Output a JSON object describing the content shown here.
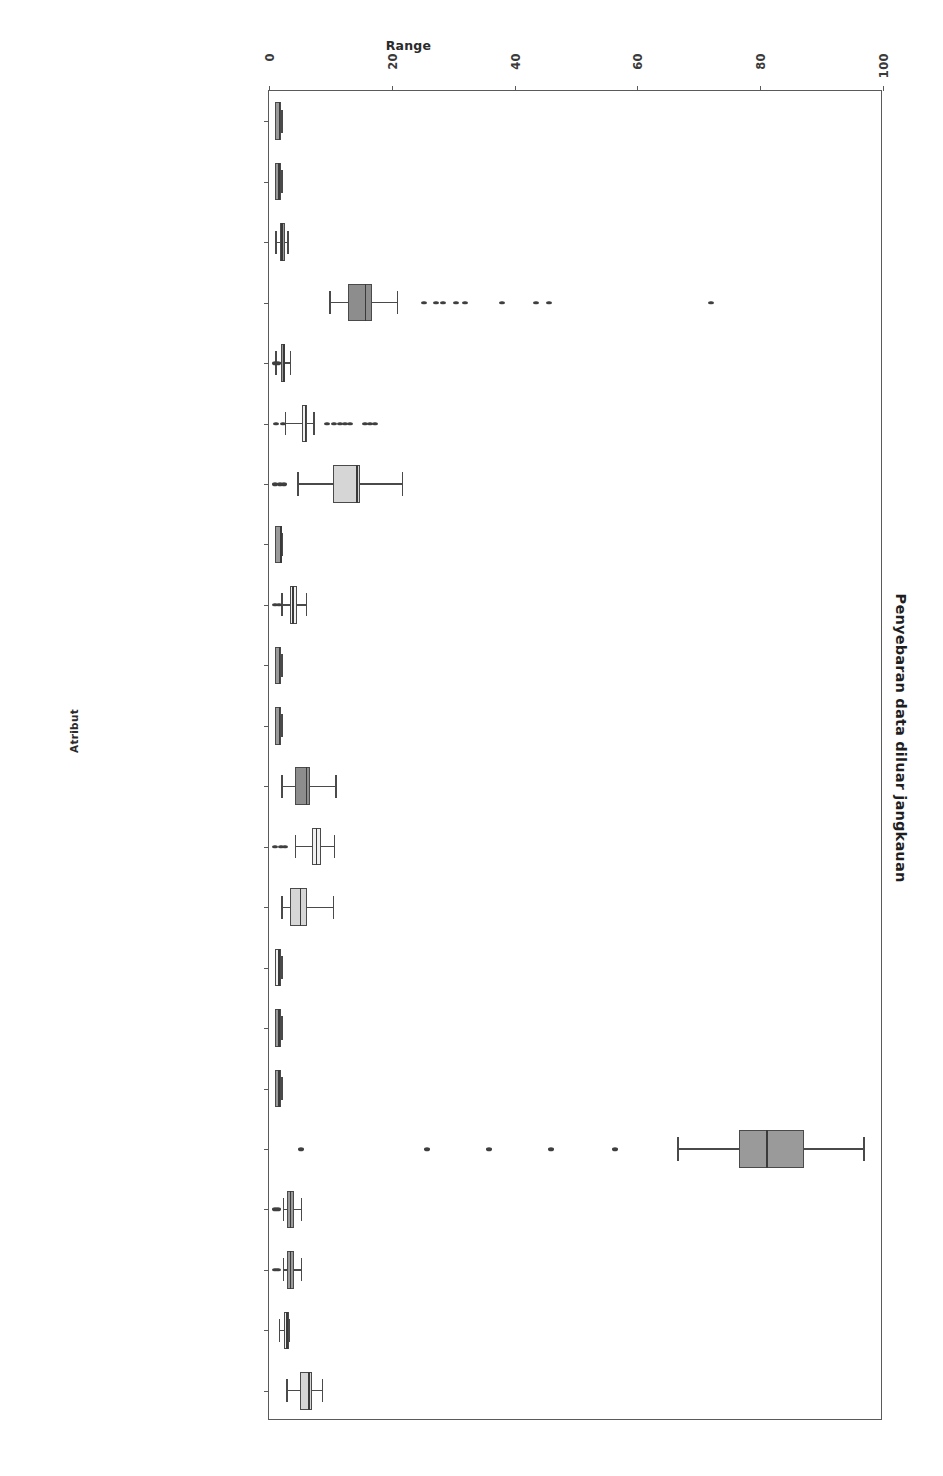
{
  "chart_title": "Penyebaran data diluar jangkauan",
  "axes": {
    "x_title": "Range",
    "y_title": "Atribut",
    "x_ticks": [
      "0",
      "20",
      "40",
      "60",
      "80",
      "100"
    ],
    "x_tick_values": [
      0,
      20,
      40,
      60,
      80,
      100
    ],
    "xlim": [
      0,
      100
    ]
  },
  "chart_data": {
    "type": "box",
    "title": "Penyebaran data diluar jangkauan",
    "xlabel": "Range",
    "ylabel": "Atribut",
    "xlim": [
      0,
      100
    ],
    "grid": false,
    "legend": "none",
    "orientation": "horizontal",
    "categories": [
      "Jenis kelamin",
      "Lokasi rumah",
      "Level pendidikan",
      "Umur",
      "Status ekonomi",
      "Jumlah anggota keluarga",
      "Jumah mata pelajaran",
      "Jenis perangkat",
      "Kecepatan internet",
      "Aktif olahraga",
      "Apakah orang tua memantau",
      "Lama belajar (jam)",
      "Lama tidur (jam)",
      "Lama bermain sosial media",
      "Suka bermain game?",
      "Mengikuti bimbingan belajar?",
      "Punya ruangan khusus",
      "Rata-rata nilai sebelum pandemi",
      "Interkasi selama PJJ",
      "Kepercayaan kegiatan PJJ",
      "kegiatan pembelajaran",
      "Keberhasilan pelaksaan PJJ"
    ],
    "boxes": [
      {
        "label": "Jenis kelamin",
        "whisker_low": 1.0,
        "q1": 1.0,
        "median": 1.6,
        "q3": 2.0,
        "whisker_high": 2.0,
        "fliers": [],
        "fill": "#9a9a9a"
      },
      {
        "label": "Lokasi rumah",
        "whisker_low": 1.0,
        "q1": 1.0,
        "median": 1.5,
        "q3": 2.0,
        "whisker_high": 2.0,
        "fliers": [],
        "fill": "#9a9a9a"
      },
      {
        "label": "Level pendidikan",
        "whisker_low": 1.0,
        "q1": 1.8,
        "median": 2.0,
        "q3": 2.6,
        "whisker_high": 3.0,
        "fliers": [],
        "fill": "#9a9a9a"
      },
      {
        "label": "Umur",
        "whisker_low": 9.8,
        "q1": 12.8,
        "median": 15.6,
        "q3": 16.8,
        "whisker_high": 20.8,
        "fliers": [
          25.3,
          27.2,
          28.4,
          30.5,
          32.0,
          38.0,
          43.5,
          45.6,
          72.0
        ],
        "fill": "#8d8d8d"
      },
      {
        "label": "Status ekonomi",
        "whisker_low": 1.0,
        "q1": 2.0,
        "median": 2.3,
        "q3": 2.6,
        "whisker_high": 3.4,
        "fliers": [
          0.9,
          1.4
        ],
        "fill": "#9a9a9a"
      },
      {
        "label": "Jumlah anggota keluarga",
        "whisker_low": 2.6,
        "q1": 5.4,
        "median": 5.8,
        "q3": 6.2,
        "whisker_high": 7.2,
        "fliers": [
          1.2,
          2.2,
          9.5,
          10.6,
          11.5,
          12.3,
          13.2,
          15.6,
          16.5,
          17.3
        ],
        "fill": "#f0f0f0"
      },
      {
        "label": "Jumah mata pelajaran",
        "whisker_low": 4.6,
        "q1": 10.5,
        "median": 14.2,
        "q3": 14.8,
        "whisker_high": 21.6,
        "fliers": [
          1.0,
          1.8,
          2.4
        ],
        "fill": "#d6d6d6"
      },
      {
        "label": "Jenis perangkat",
        "whisker_low": 1.0,
        "q1": 1.0,
        "median": 1.8,
        "q3": 2.0,
        "whisker_high": 2.0,
        "fliers": [],
        "fill": "#9a9a9a"
      },
      {
        "label": "Kecepatan internet",
        "whisker_low": 2.0,
        "q1": 3.4,
        "median": 3.8,
        "q3": 4.5,
        "whisker_high": 6.0,
        "fliers": [
          1.0,
          1.6
        ],
        "fill": "#f0f0f0"
      },
      {
        "label": "Aktif olahraga",
        "whisker_low": 1.0,
        "q1": 1.0,
        "median": 1.6,
        "q3": 2.0,
        "whisker_high": 2.0,
        "fliers": [],
        "fill": "#9a9a9a"
      },
      {
        "label": "Apakah orang tua memantau",
        "whisker_low": 1.0,
        "q1": 1.0,
        "median": 1.6,
        "q3": 2.0,
        "whisker_high": 2.0,
        "fliers": [],
        "fill": "#9a9a9a"
      },
      {
        "label": "Lama belajar (jam)",
        "whisker_low": 2.0,
        "q1": 4.2,
        "median": 6.0,
        "q3": 6.6,
        "whisker_high": 10.8,
        "fliers": [],
        "fill": "#8d8d8d"
      },
      {
        "label": "Lama tidur (jam)",
        "whisker_low": 4.2,
        "q1": 7.0,
        "median": 7.6,
        "q3": 8.4,
        "whisker_high": 10.6,
        "fliers": [
          1.0,
          2.0,
          2.6
        ],
        "fill": "#f0f0f0"
      },
      {
        "label": "Lama bermain sosial media",
        "whisker_low": 2.0,
        "q1": 3.4,
        "median": 5.0,
        "q3": 6.2,
        "whisker_high": 10.4,
        "fliers": [],
        "fill": "#d6d6d6"
      },
      {
        "label": "Suka bermain game?",
        "whisker_low": 1.0,
        "q1": 1.0,
        "median": 1.5,
        "q3": 2.0,
        "whisker_high": 2.0,
        "fliers": [],
        "fill": "#f0f0f0"
      },
      {
        "label": "Mengikuti bimbingan belajar?",
        "whisker_low": 1.0,
        "q1": 1.0,
        "median": 1.5,
        "q3": 2.0,
        "whisker_high": 2.0,
        "fliers": [],
        "fill": "#9a9a9a"
      },
      {
        "label": "Punya ruangan khusus",
        "whisker_low": 1.0,
        "q1": 1.0,
        "median": 1.5,
        "q3": 2.0,
        "whisker_high": 2.0,
        "fliers": [],
        "fill": "#9a9a9a"
      },
      {
        "label": "Rata-rata nilai sebelum pandemi",
        "whisker_low": 66.5,
        "q1": 76.6,
        "median": 81.0,
        "q3": 87.2,
        "whisker_high": 96.8,
        "fliers": [
          5.2,
          25.8,
          35.8,
          46.0,
          56.3
        ],
        "fill": "#9a9a9a"
      },
      {
        "label": "Interkasi selama PJJ",
        "whisker_low": 2.2,
        "q1": 3.0,
        "median": 3.4,
        "q3": 4.0,
        "whisker_high": 5.2,
        "fliers": [
          1.0,
          1.5
        ],
        "fill": "#9a9a9a"
      },
      {
        "label": "Kepercayaan kegiatan PJJ",
        "whisker_low": 2.2,
        "q1": 3.0,
        "median": 3.4,
        "q3": 4.0,
        "whisker_high": 5.2,
        "fliers": [
          1.0,
          1.5
        ],
        "fill": "#9a9a9a"
      },
      {
        "label": "kegiatan pembelajaran",
        "whisker_low": 1.6,
        "q1": 2.4,
        "median": 2.8,
        "q3": 3.2,
        "whisker_high": 3.2,
        "fliers": [],
        "fill": "#f0f0f0"
      },
      {
        "label": "Keberhasilan pelaksaan PJJ",
        "whisker_low": 2.8,
        "q1": 5.0,
        "median": 6.4,
        "q3": 7.0,
        "whisker_high": 8.6,
        "fliers": [],
        "fill": "#d6d6d6"
      }
    ]
  }
}
